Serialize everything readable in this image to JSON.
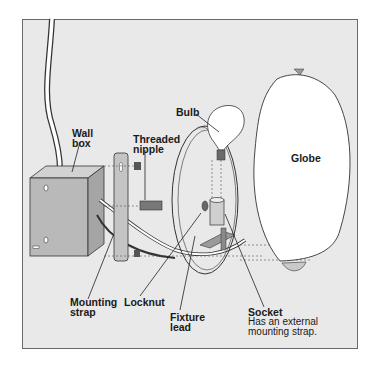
{
  "diagram": {
    "type": "exploded-assembly",
    "colors": {
      "background": "#e9e9e9",
      "frame_border": "#6a6a6a",
      "metal": "#b5b5b5",
      "line": "#333333",
      "globe_fill": "#ffffff"
    },
    "labels": {
      "wall_box": {
        "line1": "Wall",
        "line2": "box"
      },
      "threaded_nipple": {
        "line1": "Threaded",
        "line2": "nipple"
      },
      "bulb": {
        "text": "Bulb"
      },
      "globe": {
        "text": "Globe"
      },
      "mounting_strap": {
        "line1": "Mounting",
        "line2": "strap"
      },
      "locknut": {
        "text": "Locknut"
      },
      "fixture_lead": {
        "line1": "Fixture",
        "line2": "lead"
      },
      "socket": {
        "title": "Socket",
        "desc1": "Has an external",
        "desc2": "mounting strap."
      }
    }
  }
}
